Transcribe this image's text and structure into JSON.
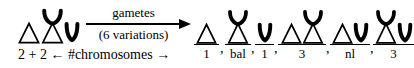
{
  "figure": {
    "parent": {
      "name": "parent-karyotype",
      "chromosomes": [
        {
          "symbol": "triangle",
          "glyph_name": "triangle-chromosome-icon"
        },
        {
          "symbol": "x-shape",
          "glyph_name": "x-chromosome-icon"
        },
        {
          "symbol": "u-shape",
          "glyph_name": "u-chromosome-icon"
        }
      ]
    },
    "arrow": {
      "top_label": "gametes",
      "bottom_label": "(6 variations)",
      "direction": "right"
    },
    "bottom_annotation": {
      "left_count": "2 + 2",
      "left_arrow": "←",
      "text": "#chromosomes",
      "right_arrow": "→"
    },
    "gametes": [
      {
        "label": "1",
        "chromosomes": [
          "triangle"
        ]
      },
      {
        "label": "bal",
        "chromosomes": [
          "x-shape"
        ]
      },
      {
        "label": "1",
        "chromosomes": [
          "u-shape"
        ]
      },
      {
        "label": "3",
        "chromosomes": [
          "triangle",
          "x-shape"
        ]
      },
      {
        "label": "nl",
        "chromosomes": [
          "triangle",
          "u-shape"
        ]
      },
      {
        "label": "3",
        "chromosomes": [
          "x-shape",
          "u-shape"
        ]
      }
    ],
    "separators": [
      ",",
      ",",
      ",",
      ",",
      ","
    ],
    "colors": {
      "ink": "#000000",
      "background": "#ffffff"
    }
  }
}
